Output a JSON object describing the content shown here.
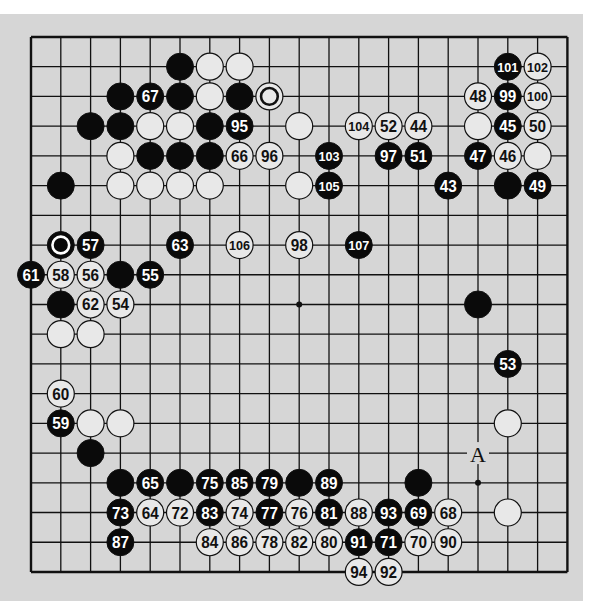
{
  "diagram": {
    "type": "go-board",
    "size": 19,
    "colors": {
      "page_background": "#d6d6d6",
      "top_margin": "#ffffff",
      "line": "#111111",
      "black_stone": "#0a0a0a",
      "white_stone": "#e8e8e8",
      "black_label_text": "#ffffff",
      "white_label_text": "#111111"
    },
    "grid": {
      "origin_x": 31,
      "origin_y": 37,
      "spacing_x": 29.8,
      "spacing_y": 29.72,
      "stone_radius": 13.5
    },
    "hoshi": [
      [
        3,
        3
      ],
      [
        9,
        3
      ],
      [
        15,
        3
      ],
      [
        3,
        9
      ],
      [
        9,
        9
      ],
      [
        15,
        9
      ],
      [
        3,
        15
      ],
      [
        9,
        15
      ],
      [
        15,
        15
      ]
    ],
    "stones": [
      {
        "c": 5,
        "r": 1,
        "color": "black"
      },
      {
        "c": 3,
        "r": 2,
        "color": "black"
      },
      {
        "c": 5,
        "r": 2,
        "color": "black"
      },
      {
        "c": 7,
        "r": 2,
        "color": "black"
      },
      {
        "c": 2,
        "r": 3,
        "color": "black"
      },
      {
        "c": 3,
        "r": 3,
        "color": "black"
      },
      {
        "c": 6,
        "r": 3,
        "color": "black"
      },
      {
        "c": 4,
        "r": 4,
        "color": "black"
      },
      {
        "c": 5,
        "r": 4,
        "color": "black"
      },
      {
        "c": 6,
        "r": 4,
        "color": "black"
      },
      {
        "c": 1,
        "r": 5,
        "color": "black"
      },
      {
        "c": 1,
        "r": 7,
        "color": "black",
        "marker": "circle"
      },
      {
        "c": 3,
        "r": 8,
        "color": "black"
      },
      {
        "c": 1,
        "r": 9,
        "color": "black"
      },
      {
        "c": 16,
        "r": 5,
        "color": "black"
      },
      {
        "c": 15,
        "r": 9,
        "color": "black"
      },
      {
        "c": 2,
        "r": 14,
        "color": "black"
      },
      {
        "c": 3,
        "r": 15,
        "color": "black"
      },
      {
        "c": 5,
        "r": 15,
        "color": "black"
      },
      {
        "c": 9,
        "r": 15,
        "color": "black"
      },
      {
        "c": 13,
        "r": 15,
        "color": "black"
      },
      {
        "c": 4,
        "r": 2,
        "color": "black",
        "label": "67"
      },
      {
        "c": 7,
        "r": 3,
        "color": "black",
        "label": "95"
      },
      {
        "c": 2,
        "r": 7,
        "color": "black",
        "label": "57"
      },
      {
        "c": 5,
        "r": 7,
        "color": "black",
        "label": "63"
      },
      {
        "c": 0,
        "r": 8,
        "color": "black",
        "label": "61"
      },
      {
        "c": 4,
        "r": 8,
        "color": "black",
        "label": "55"
      },
      {
        "c": 16,
        "r": 1,
        "color": "black",
        "label": "101"
      },
      {
        "c": 16,
        "r": 2,
        "color": "black",
        "label": "99"
      },
      {
        "c": 16,
        "r": 3,
        "color": "black",
        "label": "45"
      },
      {
        "c": 10,
        "r": 4,
        "color": "black",
        "label": "103"
      },
      {
        "c": 12,
        "r": 4,
        "color": "black",
        "label": "97"
      },
      {
        "c": 13,
        "r": 4,
        "color": "black",
        "label": "51"
      },
      {
        "c": 15,
        "r": 4,
        "color": "black",
        "label": "47"
      },
      {
        "c": 10,
        "r": 5,
        "color": "black",
        "label": "105"
      },
      {
        "c": 14,
        "r": 5,
        "color": "black",
        "label": "43"
      },
      {
        "c": 17,
        "r": 5,
        "color": "black",
        "label": "49"
      },
      {
        "c": 11,
        "r": 7,
        "color": "black",
        "label": "107"
      },
      {
        "c": 16,
        "r": 11,
        "color": "black",
        "label": "53"
      },
      {
        "c": 1,
        "r": 13,
        "color": "black",
        "label": "59"
      },
      {
        "c": 4,
        "r": 15,
        "color": "black",
        "label": "65"
      },
      {
        "c": 6,
        "r": 15,
        "color": "black",
        "label": "75"
      },
      {
        "c": 7,
        "r": 15,
        "color": "black",
        "label": "85"
      },
      {
        "c": 8,
        "r": 15,
        "color": "black",
        "label": "79"
      },
      {
        "c": 10,
        "r": 15,
        "color": "black",
        "label": "89"
      },
      {
        "c": 3,
        "r": 16,
        "color": "black",
        "label": "73"
      },
      {
        "c": 6,
        "r": 16,
        "color": "black",
        "label": "83"
      },
      {
        "c": 8,
        "r": 16,
        "color": "black",
        "label": "77"
      },
      {
        "c": 10,
        "r": 16,
        "color": "black",
        "label": "81"
      },
      {
        "c": 12,
        "r": 16,
        "color": "black",
        "label": "93"
      },
      {
        "c": 13,
        "r": 16,
        "color": "black",
        "label": "69"
      },
      {
        "c": 3,
        "r": 17,
        "color": "black",
        "label": "87"
      },
      {
        "c": 11,
        "r": 17,
        "color": "black",
        "label": "91"
      },
      {
        "c": 12,
        "r": 17,
        "color": "black",
        "label": "71"
      },
      {
        "c": 6,
        "r": 1,
        "color": "white"
      },
      {
        "c": 7,
        "r": 1,
        "color": "white"
      },
      {
        "c": 6,
        "r": 2,
        "color": "white"
      },
      {
        "c": 8,
        "r": 2,
        "color": "white",
        "marker": "circle"
      },
      {
        "c": 4,
        "r": 3,
        "color": "white"
      },
      {
        "c": 5,
        "r": 3,
        "color": "white"
      },
      {
        "c": 9,
        "r": 3,
        "color": "white"
      },
      {
        "c": 15,
        "r": 3,
        "color": "white"
      },
      {
        "c": 3,
        "r": 4,
        "color": "white"
      },
      {
        "c": 17,
        "r": 4,
        "color": "white"
      },
      {
        "c": 3,
        "r": 5,
        "color": "white"
      },
      {
        "c": 4,
        "r": 5,
        "color": "white"
      },
      {
        "c": 5,
        "r": 5,
        "color": "white"
      },
      {
        "c": 6,
        "r": 5,
        "color": "white"
      },
      {
        "c": 9,
        "r": 5,
        "color": "white"
      },
      {
        "c": 1,
        "r": 10,
        "color": "white"
      },
      {
        "c": 2,
        "r": 10,
        "color": "white"
      },
      {
        "c": 2,
        "r": 13,
        "color": "white"
      },
      {
        "c": 3,
        "r": 13,
        "color": "white"
      },
      {
        "c": 16,
        "r": 13,
        "color": "white"
      },
      {
        "c": 16,
        "r": 16,
        "color": "white"
      },
      {
        "c": 17,
        "r": 1,
        "color": "white",
        "label": "102"
      },
      {
        "c": 15,
        "r": 2,
        "color": "white",
        "label": "48"
      },
      {
        "c": 17,
        "r": 2,
        "color": "white",
        "label": "100"
      },
      {
        "c": 11,
        "r": 3,
        "color": "white",
        "label": "104"
      },
      {
        "c": 12,
        "r": 3,
        "color": "white",
        "label": "52"
      },
      {
        "c": 13,
        "r": 3,
        "color": "white",
        "label": "44"
      },
      {
        "c": 17,
        "r": 3,
        "color": "white",
        "label": "50"
      },
      {
        "c": 7,
        "r": 4,
        "color": "white",
        "label": "66"
      },
      {
        "c": 8,
        "r": 4,
        "color": "white",
        "label": "96"
      },
      {
        "c": 16,
        "r": 4,
        "color": "white",
        "label": "46"
      },
      {
        "c": 7,
        "r": 7,
        "color": "white",
        "label": "106"
      },
      {
        "c": 9,
        "r": 7,
        "color": "white",
        "label": "98"
      },
      {
        "c": 1,
        "r": 8,
        "color": "white",
        "label": "58"
      },
      {
        "c": 2,
        "r": 8,
        "color": "white",
        "label": "56"
      },
      {
        "c": 2,
        "r": 9,
        "color": "white",
        "label": "62"
      },
      {
        "c": 3,
        "r": 9,
        "color": "white",
        "label": "54"
      },
      {
        "c": 1,
        "r": 12,
        "color": "white",
        "label": "60"
      },
      {
        "c": 4,
        "r": 16,
        "color": "white",
        "label": "64"
      },
      {
        "c": 5,
        "r": 16,
        "color": "white",
        "label": "72"
      },
      {
        "c": 7,
        "r": 16,
        "color": "white",
        "label": "74"
      },
      {
        "c": 9,
        "r": 16,
        "color": "white",
        "label": "76"
      },
      {
        "c": 11,
        "r": 16,
        "color": "white",
        "label": "88"
      },
      {
        "c": 14,
        "r": 16,
        "color": "white",
        "label": "68"
      },
      {
        "c": 6,
        "r": 17,
        "color": "white",
        "label": "84"
      },
      {
        "c": 7,
        "r": 17,
        "color": "white",
        "label": "86"
      },
      {
        "c": 8,
        "r": 17,
        "color": "white",
        "label": "78"
      },
      {
        "c": 9,
        "r": 17,
        "color": "white",
        "label": "82"
      },
      {
        "c": 10,
        "r": 17,
        "color": "white",
        "label": "80"
      },
      {
        "c": 13,
        "r": 17,
        "color": "white",
        "label": "70"
      },
      {
        "c": 14,
        "r": 17,
        "color": "white",
        "label": "90"
      },
      {
        "c": 11,
        "r": 18,
        "color": "white",
        "label": "94"
      },
      {
        "c": 12,
        "r": 18,
        "color": "white",
        "label": "92"
      }
    ],
    "point_labels": [
      {
        "c": 15,
        "r": 14,
        "text": "A"
      }
    ]
  }
}
